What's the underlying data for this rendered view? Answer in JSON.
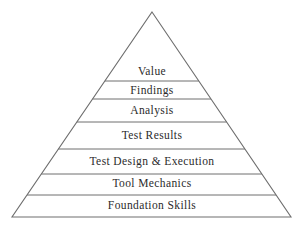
{
  "figure": {
    "name": "testing-maturity-pyramid",
    "shape": "triangle",
    "background_color": "#ffffff",
    "stroke_color": "#6e6e6e",
    "text_color": "#2b2b2b",
    "apex": {
      "x": 152,
      "y": 12
    },
    "base_left": {
      "x": 12,
      "y": 217
    },
    "base_right": {
      "x": 291,
      "y": 217
    }
  },
  "bands": [
    {
      "label": "Value",
      "level": 7,
      "top_y": 12,
      "bottom_y": 81,
      "text_y": 65,
      "font_size": 11.5
    },
    {
      "label": "Findings",
      "level": 6,
      "top_y": 81,
      "bottom_y": 99,
      "text_y": 84,
      "font_size": 11.5
    },
    {
      "label": "Analysis",
      "level": 5,
      "top_y": 99,
      "bottom_y": 122,
      "text_y": 104,
      "font_size": 11.5
    },
    {
      "label": "Test Results",
      "level": 4,
      "top_y": 122,
      "bottom_y": 149,
      "text_y": 129,
      "font_size": 11.5
    },
    {
      "label": "Test Design & Execution",
      "level": 3,
      "top_y": 149,
      "bottom_y": 174,
      "text_y": 155,
      "font_size": 11.5
    },
    {
      "label": "Tool Mechanics",
      "level": 2,
      "top_y": 174,
      "bottom_y": 195,
      "text_y": 177,
      "font_size": 11.5
    },
    {
      "label": "Foundation Skills",
      "level": 1,
      "top_y": 195,
      "bottom_y": 217,
      "text_y": 199,
      "font_size": 11.5
    }
  ],
  "dividers": [
    {
      "y": 81
    },
    {
      "y": 99
    },
    {
      "y": 122
    },
    {
      "y": 149
    },
    {
      "y": 174
    },
    {
      "y": 195
    }
  ],
  "chart_data": {
    "type": "pyramid",
    "title": "",
    "orientation": "bottom-widest",
    "categories": [
      "Foundation Skills",
      "Tool Mechanics",
      "Test Design & Execution",
      "Test Results",
      "Analysis",
      "Findings",
      "Value"
    ],
    "levels": [
      {
        "rank": 1,
        "label": "Foundation Skills",
        "band_height_px": 22
      },
      {
        "rank": 2,
        "label": "Tool Mechanics",
        "band_height_px": 21
      },
      {
        "rank": 3,
        "label": "Test Design & Execution",
        "band_height_px": 25
      },
      {
        "rank": 4,
        "label": "Test Results",
        "band_height_px": 27
      },
      {
        "rank": 5,
        "label": "Analysis",
        "band_height_px": 23
      },
      {
        "rank": 6,
        "label": "Findings",
        "band_height_px": 18
      },
      {
        "rank": 7,
        "label": "Value",
        "band_height_px": 69
      }
    ],
    "xlabel": "",
    "ylabel": "",
    "grid": false,
    "legend": false
  }
}
